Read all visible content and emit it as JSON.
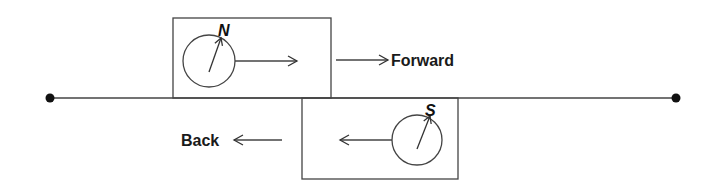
{
  "diagram": {
    "colors": {
      "stroke": "#333333",
      "text": "#1a1a1a",
      "background": "#ffffff"
    },
    "track": {
      "x1": 50,
      "x2": 676,
      "y": 98,
      "endpoint_radius": 4.5
    },
    "forward_unit": {
      "box": {
        "x": 173,
        "y": 18,
        "w": 158,
        "h": 80
      },
      "compass": {
        "cx": 209,
        "cy": 61,
        "r": 26,
        "needle_label": "N"
      },
      "inner_arrow": {
        "x1": 235,
        "x2": 297,
        "y": 61
      }
    },
    "backward_unit": {
      "box": {
        "x": 302,
        "y": 98,
        "w": 156,
        "h": 81
      },
      "compass": {
        "cx": 417,
        "cy": 140,
        "r": 25,
        "needle_label": "S"
      },
      "inner_arrow": {
        "x1": 392,
        "x2": 340,
        "y": 140
      }
    },
    "labels": {
      "forward": "Forward",
      "back": "Back"
    }
  }
}
